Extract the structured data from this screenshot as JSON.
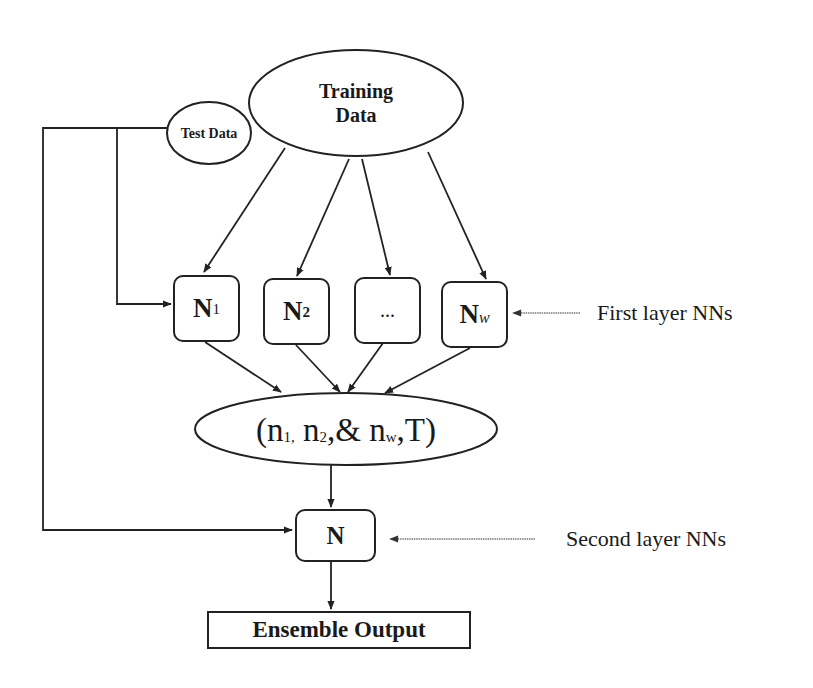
{
  "diagram": {
    "type": "ensemble-neural-network-flow",
    "nodes": {
      "training_data": {
        "line1": "Training",
        "line2": "Data"
      },
      "test_data": {
        "label": "Test Data"
      },
      "first_layer": [
        {
          "main": "N",
          "sub": "1"
        },
        {
          "main": "N",
          "sub": "2"
        },
        {
          "main": "...",
          "sub": ""
        },
        {
          "main": "N",
          "sub": "W"
        }
      ],
      "aggregate": {
        "open": "(n",
        "s1": "1,",
        "mid1": " n",
        "s2": "2",
        "mid2": ",& n",
        "sw": "w",
        "close": ",T)"
      },
      "second_layer": {
        "label": "N"
      },
      "output": {
        "label": "Ensemble Output"
      }
    },
    "annotations": {
      "first_layer": "First layer NNs",
      "second_layer": "Second layer NNs"
    },
    "edges": [
      {
        "from": "training_data",
        "to": "N1"
      },
      {
        "from": "training_data",
        "to": "N2"
      },
      {
        "from": "training_data",
        "to": "..."
      },
      {
        "from": "training_data",
        "to": "NW"
      },
      {
        "from": "test_data",
        "to": "N1"
      },
      {
        "from": "test_data",
        "to": "N"
      },
      {
        "from": "N1",
        "to": "aggregate"
      },
      {
        "from": "N2",
        "to": "aggregate"
      },
      {
        "from": "...",
        "to": "aggregate"
      },
      {
        "from": "NW",
        "to": "aggregate"
      },
      {
        "from": "aggregate",
        "to": "N"
      },
      {
        "from": "N",
        "to": "output"
      }
    ],
    "colors": {
      "stroke": "#222222",
      "annotation_arrow": "#777777",
      "background": "#ffffff"
    }
  }
}
